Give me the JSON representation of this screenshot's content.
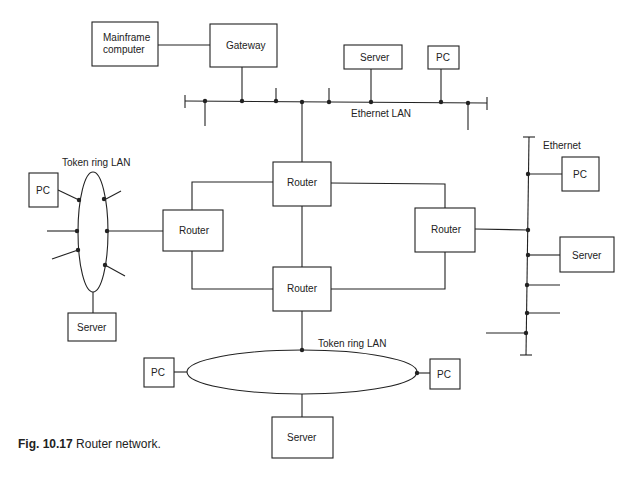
{
  "diagram": {
    "title": "Router network",
    "nodes": {
      "mainframe": {
        "label_line1": "Mainframe",
        "label_line2": "computer"
      },
      "gateway": {
        "label": "Gateway"
      },
      "eth_top_server": {
        "label": "Server"
      },
      "eth_top_pc": {
        "label": "PC"
      },
      "router_top": {
        "label": "Router"
      },
      "router_left": {
        "label": "Router"
      },
      "router_right": {
        "label": "Router"
      },
      "router_bottom": {
        "label": "Router"
      },
      "ring_left_pc": {
        "label": "PC"
      },
      "ring_left_server": {
        "label": "Server"
      },
      "eth_right_pc": {
        "label": "PC"
      },
      "eth_right_server": {
        "label": "Server"
      },
      "ring_bottom_pc_left": {
        "label": "PC"
      },
      "ring_bottom_pc_right": {
        "label": "PC"
      },
      "ring_bottom_server": {
        "label": "Server"
      }
    },
    "networks": {
      "ethernet_top": {
        "label": "Ethernet LAN"
      },
      "token_ring_left": {
        "label": "Token ring LAN"
      },
      "ethernet_right": {
        "label": "Ethernet"
      },
      "token_ring_bottom": {
        "label": "Token ring LAN"
      }
    },
    "edges": [
      [
        "mainframe",
        "gateway"
      ],
      [
        "gateway",
        "ethernet_top"
      ],
      [
        "eth_top_server",
        "ethernet_top"
      ],
      [
        "eth_top_pc",
        "ethernet_top"
      ],
      [
        "ethernet_top",
        "router_top"
      ],
      [
        "router_top",
        "router_left"
      ],
      [
        "router_top",
        "router_right"
      ],
      [
        "router_top",
        "router_bottom"
      ],
      [
        "router_left",
        "router_bottom"
      ],
      [
        "router_right",
        "router_bottom"
      ],
      [
        "router_left",
        "token_ring_left"
      ],
      [
        "ring_left_pc",
        "token_ring_left"
      ],
      [
        "ring_left_server",
        "token_ring_left"
      ],
      [
        "router_right",
        "ethernet_right"
      ],
      [
        "eth_right_pc",
        "ethernet_right"
      ],
      [
        "eth_right_server",
        "ethernet_right"
      ],
      [
        "router_bottom",
        "token_ring_bottom"
      ],
      [
        "ring_bottom_pc_left",
        "token_ring_bottom"
      ],
      [
        "ring_bottom_pc_right",
        "token_ring_bottom"
      ],
      [
        "ring_bottom_server",
        "token_ring_bottom"
      ]
    ]
  },
  "caption": {
    "fig_number": "Fig. 10.17",
    "text": "Router network."
  }
}
